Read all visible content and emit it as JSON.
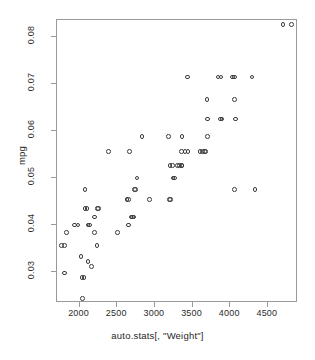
{
  "chart_data": {
    "type": "scatter",
    "title": "",
    "xlabel": "auto.stats[, \"Weight\"]",
    "ylabel": "mpg",
    "xlim": [
      1700,
      4900
    ],
    "ylim": [
      0.0235,
      0.0835
    ],
    "xticks": [
      2000,
      2500,
      3000,
      3500,
      4000,
      4500
    ],
    "yticks": [
      0.03,
      0.04,
      0.05,
      0.06,
      0.07,
      0.08
    ],
    "xtick_labels": [
      "2000",
      "2500",
      "3000",
      "3500",
      "4000",
      "4500"
    ],
    "ytick_labels": [
      "0.03",
      "0.04",
      "0.05",
      "0.06",
      "0.07",
      "0.08"
    ],
    "grid": false,
    "legend": null,
    "marker": "open-circle",
    "marker_color": "#3d3d3d",
    "frame": true,
    "points": [
      {
        "x": 1760,
        "y": 0.0357
      },
      {
        "x": 1800,
        "y": 0.0357
      },
      {
        "x": 1800,
        "y": 0.0299
      },
      {
        "x": 1830,
        "y": 0.0385
      },
      {
        "x": 1930,
        "y": 0.04
      },
      {
        "x": 1980,
        "y": 0.04
      },
      {
        "x": 2020,
        "y": 0.0333
      },
      {
        "x": 2030,
        "y": 0.0289
      },
      {
        "x": 2060,
        "y": 0.0289
      },
      {
        "x": 2040,
        "y": 0.0244
      },
      {
        "x": 2070,
        "y": 0.0476
      },
      {
        "x": 2070,
        "y": 0.0435
      },
      {
        "x": 2100,
        "y": 0.0435
      },
      {
        "x": 2110,
        "y": 0.04
      },
      {
        "x": 2130,
        "y": 0.04
      },
      {
        "x": 2110,
        "y": 0.0323
      },
      {
        "x": 2160,
        "y": 0.0313
      },
      {
        "x": 2200,
        "y": 0.0417
      },
      {
        "x": 2200,
        "y": 0.0385
      },
      {
        "x": 2240,
        "y": 0.0435
      },
      {
        "x": 2250,
        "y": 0.0435
      },
      {
        "x": 2230,
        "y": 0.0357
      },
      {
        "x": 2380,
        "y": 0.0556
      },
      {
        "x": 2500,
        "y": 0.0385
      },
      {
        "x": 2630,
        "y": 0.0455
      },
      {
        "x": 2650,
        "y": 0.0455
      },
      {
        "x": 2660,
        "y": 0.0556
      },
      {
        "x": 2650,
        "y": 0.04
      },
      {
        "x": 2680,
        "y": 0.0417
      },
      {
        "x": 2700,
        "y": 0.0417
      },
      {
        "x": 2720,
        "y": 0.0417
      },
      {
        "x": 2730,
        "y": 0.0476
      },
      {
        "x": 2740,
        "y": 0.0476
      },
      {
        "x": 2760,
        "y": 0.05
      },
      {
        "x": 2830,
        "y": 0.0588
      },
      {
        "x": 2930,
        "y": 0.0455
      },
      {
        "x": 3180,
        "y": 0.0588
      },
      {
        "x": 3190,
        "y": 0.0455
      },
      {
        "x": 3210,
        "y": 0.0455
      },
      {
        "x": 3200,
        "y": 0.0526
      },
      {
        "x": 3230,
        "y": 0.0526
      },
      {
        "x": 3240,
        "y": 0.05
      },
      {
        "x": 3260,
        "y": 0.05
      },
      {
        "x": 3300,
        "y": 0.0526
      },
      {
        "x": 3330,
        "y": 0.0526
      },
      {
        "x": 3350,
        "y": 0.0526
      },
      {
        "x": 3360,
        "y": 0.0526
      },
      {
        "x": 3350,
        "y": 0.0556
      },
      {
        "x": 3400,
        "y": 0.0556
      },
      {
        "x": 3360,
        "y": 0.0588
      },
      {
        "x": 3430,
        "y": 0.0714
      },
      {
        "x": 3440,
        "y": 0.0556
      },
      {
        "x": 3600,
        "y": 0.0556
      },
      {
        "x": 3630,
        "y": 0.0556
      },
      {
        "x": 3660,
        "y": 0.0556
      },
      {
        "x": 3670,
        "y": 0.0556
      },
      {
        "x": 3700,
        "y": 0.0625
      },
      {
        "x": 3690,
        "y": 0.0667
      },
      {
        "x": 3700,
        "y": 0.0588
      },
      {
        "x": 3840,
        "y": 0.0714
      },
      {
        "x": 3880,
        "y": 0.0714
      },
      {
        "x": 3870,
        "y": 0.0625
      },
      {
        "x": 3890,
        "y": 0.0625
      },
      {
        "x": 4030,
        "y": 0.0714
      },
      {
        "x": 4060,
        "y": 0.0714
      },
      {
        "x": 4060,
        "y": 0.0667
      },
      {
        "x": 4070,
        "y": 0.0625
      },
      {
        "x": 4060,
        "y": 0.0476
      },
      {
        "x": 4290,
        "y": 0.0714
      },
      {
        "x": 4330,
        "y": 0.0476
      },
      {
        "x": 4700,
        "y": 0.0826
      },
      {
        "x": 4810,
        "y": 0.0826
      }
    ]
  }
}
